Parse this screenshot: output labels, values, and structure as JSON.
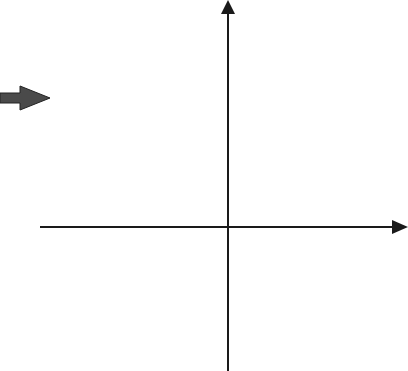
{
  "fragment_text": "e.",
  "arrow": {
    "icon": "right-arrow-icon",
    "color": "#4a4a4a"
  },
  "chart_data": {
    "type": "line",
    "title": "",
    "xlabel": "x",
    "ylabel": "y",
    "xlim": [
      -3,
      3.1
    ],
    "ylim": [
      -2.5,
      3.95
    ],
    "grid": true,
    "grid_minor_step": 0.2,
    "x_ticks": [
      -3,
      -2,
      -1,
      0,
      1,
      2
    ],
    "x_tick_labels": [
      "−3",
      "−2",
      "−1",
      "0",
      "1",
      "2"
    ],
    "y_ticks": [
      3,
      2,
      1,
      -1,
      -2
    ],
    "y_tick_labels": [
      "3",
      "2",
      "1",
      "−1",
      "−2"
    ],
    "series": [
      {
        "name": "parabola",
        "equation_estimate": "y = -x^2 - x + 3",
        "x": [
          -2.9,
          -2.5,
          -2.3,
          -2.0,
          -1.5,
          -1.0,
          -0.5,
          0.0,
          0.5,
          1.0,
          1.3,
          1.5,
          1.9
        ],
        "y": [
          -2.51,
          -0.75,
          0.01,
          1.0,
          2.25,
          3.0,
          3.25,
          3.0,
          2.25,
          1.0,
          0.01,
          -0.75,
          -2.51
        ]
      }
    ],
    "annotations": {
      "vertex": [
        -0.5,
        3.25
      ],
      "x_intercepts": [
        -2.3,
        1.3
      ],
      "y_intercept": 3
    }
  },
  "axis_labels": {
    "x": "x",
    "y": "y"
  },
  "tick_labels": {
    "x": [
      "−3",
      "−2",
      "−1",
      "0",
      "1",
      "2"
    ],
    "y": [
      "3",
      "2",
      "1",
      "−1",
      "−2"
    ]
  }
}
